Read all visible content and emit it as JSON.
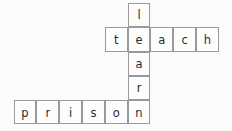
{
  "board": {
    "background_color": "#fbfbfb",
    "cell_fill_color": "#fdfdfd",
    "cell_border_color": "#9a9a9a",
    "letter_color": "#2b2b2b",
    "cell_width": 22.8,
    "cell_height": 24.3,
    "origin_x": 13.6,
    "origin_y": 3.0,
    "columns": 10,
    "rows": 5
  },
  "words": [
    {
      "text": "learn",
      "direction": "vertical",
      "start_col": 5,
      "start_row": 0,
      "length": 5
    },
    {
      "text": "teach",
      "direction": "horizontal",
      "start_col": 4,
      "start_row": 1,
      "length": 5
    },
    {
      "text": "prison",
      "direction": "horizontal",
      "start_col": 0,
      "start_row": 4,
      "length": 6
    }
  ],
  "cells": [
    {
      "letter": "l",
      "col": 5,
      "row": 0
    },
    {
      "letter": "t",
      "col": 4,
      "row": 1
    },
    {
      "letter": "e",
      "col": 5,
      "row": 1
    },
    {
      "letter": "a",
      "col": 6,
      "row": 1
    },
    {
      "letter": "c",
      "col": 7,
      "row": 1
    },
    {
      "letter": "h",
      "col": 8,
      "row": 1
    },
    {
      "letter": "a",
      "col": 5,
      "row": 2
    },
    {
      "letter": "r",
      "col": 5,
      "row": 3
    },
    {
      "letter": "p",
      "col": 0,
      "row": 4
    },
    {
      "letter": "r",
      "col": 1,
      "row": 4
    },
    {
      "letter": "i",
      "col": 2,
      "row": 4
    },
    {
      "letter": "s",
      "col": 3,
      "row": 4
    },
    {
      "letter": "o",
      "col": 4,
      "row": 4
    },
    {
      "letter": "n",
      "col": 5,
      "row": 4
    }
  ]
}
